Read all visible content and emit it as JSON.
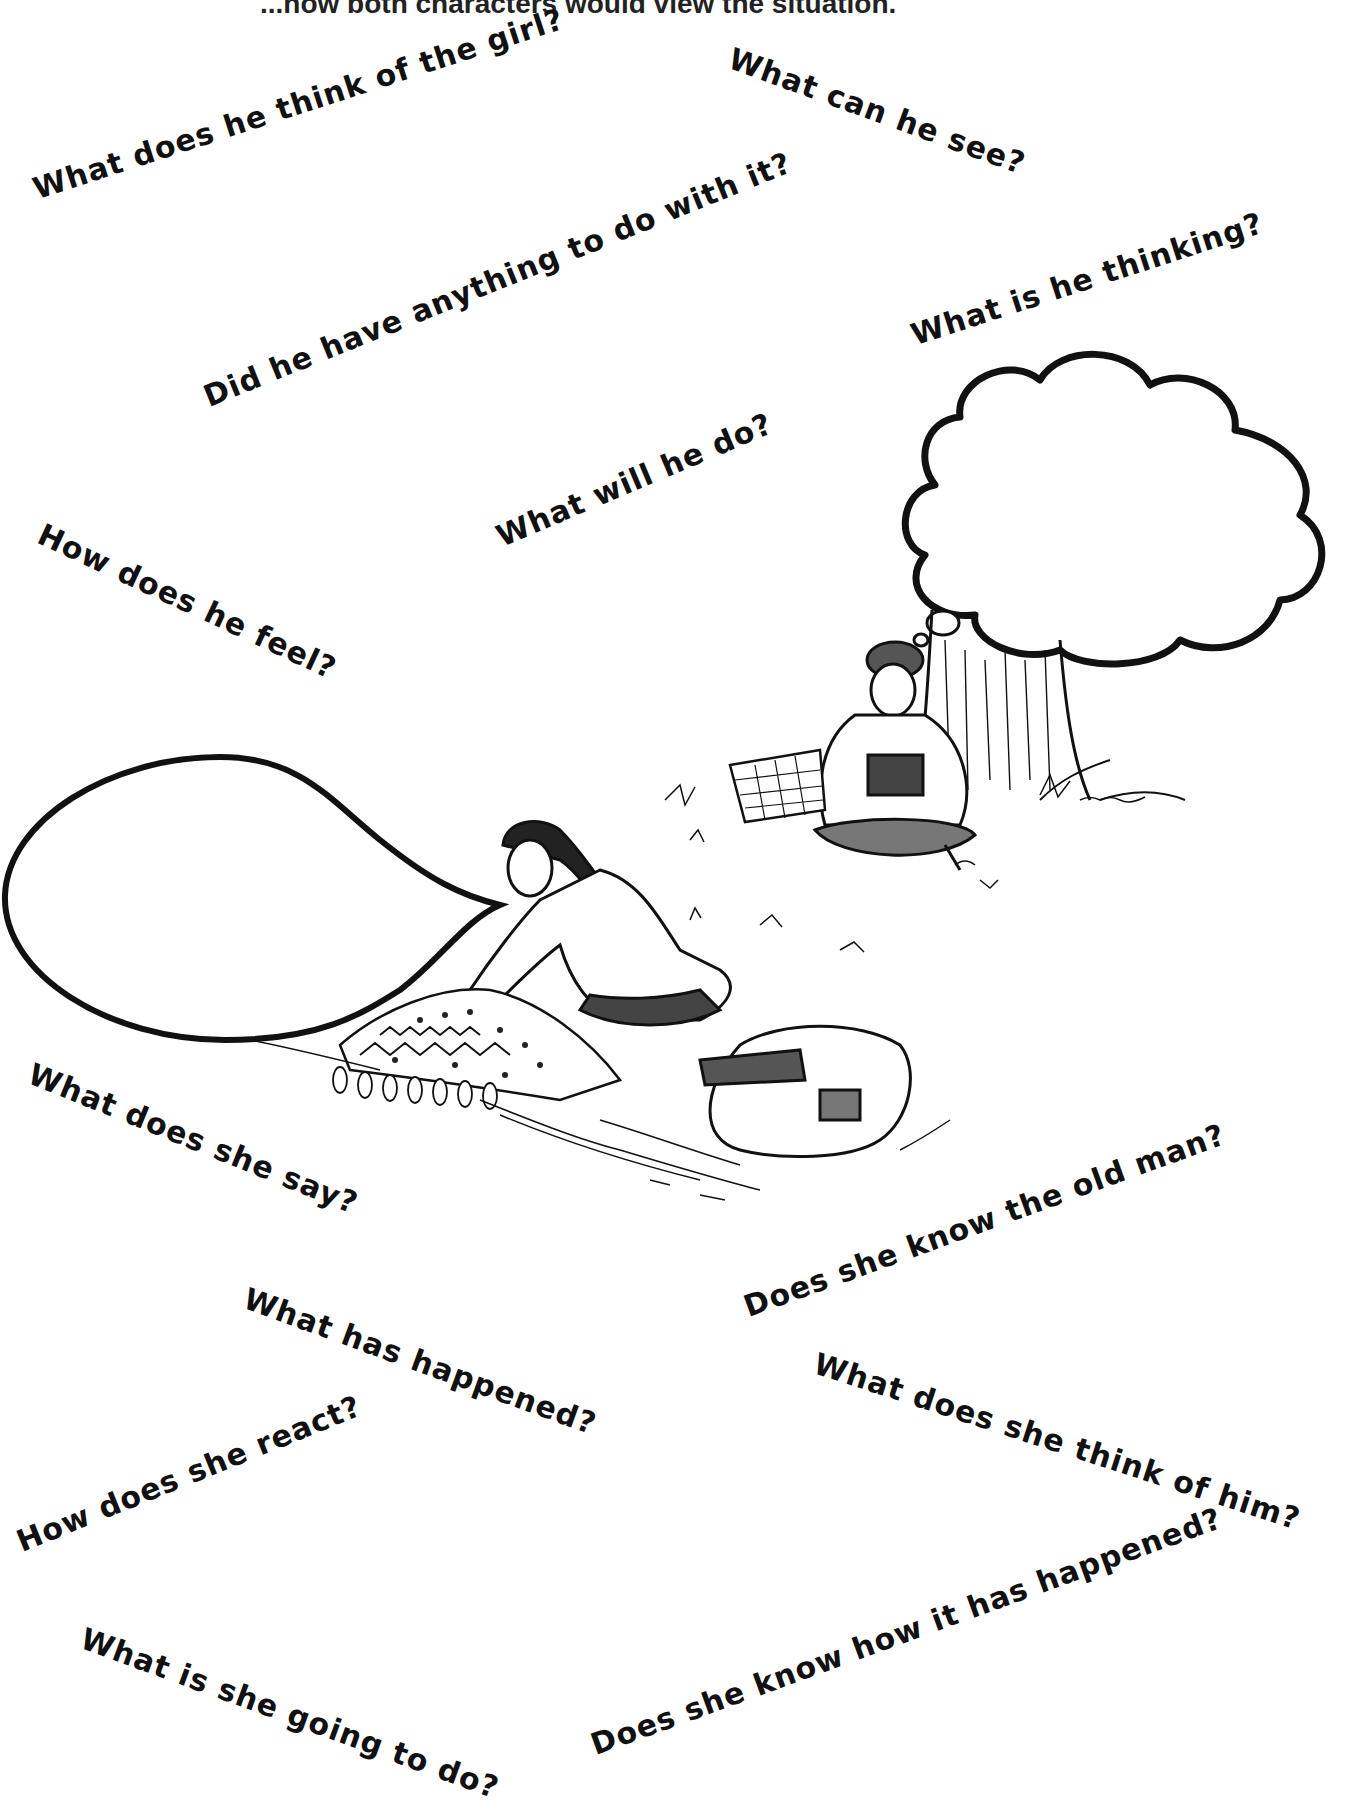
{
  "header": {
    "instruction_partial": "...how both characters would view the situation."
  },
  "questions_about_him": [
    {
      "text": "What does he think of the girl?",
      "x": 34,
      "y": 192,
      "angle": -18
    },
    {
      "text": "What can he see?",
      "x": 730,
      "y": 50,
      "angle": 20
    },
    {
      "text": "Did he have anything to do with it?",
      "x": 205,
      "y": 402,
      "angle": -22
    },
    {
      "text": "What is he thinking?",
      "x": 915,
      "y": 330,
      "angle": -18
    },
    {
      "text": "What will he do?",
      "x": 498,
      "y": 535,
      "angle": -23
    },
    {
      "text": "How does he feel?",
      "x": 40,
      "y": 530,
      "angle": 25
    }
  ],
  "questions_about_her": [
    {
      "text": "What does she say?",
      "x": 30,
      "y": 1070,
      "angle": 22
    },
    {
      "text": "What has happened?",
      "x": 245,
      "y": 1290,
      "angle": 20
    },
    {
      "text": "Does she know the old man?",
      "x": 745,
      "y": 1308,
      "angle": -20
    },
    {
      "text": "What does she think of him?",
      "x": 815,
      "y": 1358,
      "angle": 18
    },
    {
      "text": "How does she react?",
      "x": 18,
      "y": 1543,
      "angle": -22
    },
    {
      "text": "What is she going to do?",
      "x": 82,
      "y": 1632,
      "angle": 20
    },
    {
      "text": "Does she know how it has happened?",
      "x": 592,
      "y": 1746,
      "angle": -20
    }
  ],
  "bubbles": {
    "thought_bubble": "empty",
    "speech_bubble": "empty"
  },
  "illustration": {
    "characters": [
      "old man with turban reading a book under a tree",
      "girl kneeling beside a patterned blanket"
    ],
    "objects": [
      "tree trunk",
      "woven basket",
      "patterned blanket with tassels",
      "broken basket on ground"
    ]
  }
}
